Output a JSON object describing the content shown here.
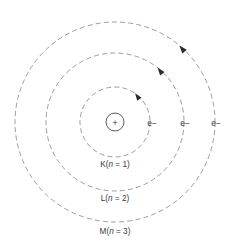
{
  "figure": {
    "background_color": "#ffffff",
    "orbit_color": "#8a8a8a",
    "text_color": "#3a3a3a",
    "arrow_color": "#2b2b2b",
    "center": {
      "x": 115,
      "y": 122
    }
  },
  "nucleus": {
    "symbol": "+",
    "radius": 9,
    "name": "nucleus"
  },
  "shells": [
    {
      "key": "K",
      "label_letter": "K",
      "label_paren_open": "(",
      "label_var": "n",
      "label_eq": " = ",
      "label_value": "1",
      "label_paren_close": ")",
      "label_full": "K(n = 1)",
      "radius": 35,
      "label_x": 115,
      "label_y": 167
    },
    {
      "key": "L",
      "label_letter": "L",
      "label_paren_open": "(",
      "label_var": "n",
      "label_eq": " = ",
      "label_value": "2",
      "label_paren_close": ")",
      "label_full": "L(n = 2)",
      "radius": 69,
      "label_x": 115,
      "label_y": 201
    },
    {
      "key": "M",
      "label_letter": "M",
      "label_paren_open": "(",
      "label_var": "n",
      "label_eq": " = ",
      "label_value": "3",
      "label_paren_close": ")",
      "label_full": "M(n = 3)",
      "radius": 100,
      "label_x": 115,
      "label_y": 234
    }
  ],
  "electrons": [
    {
      "shell": "K",
      "label": "e−",
      "x": 152,
      "y": 126
    },
    {
      "shell": "L",
      "label": "e−",
      "x": 185,
      "y": 126
    },
    {
      "shell": "M",
      "label": "e−",
      "x": 216,
      "y": 126
    }
  ],
  "arrows": [
    {
      "shell": "K",
      "direction": "counterclockwise",
      "angle_deg": 55
    },
    {
      "shell": "L",
      "direction": "counterclockwise",
      "angle_deg": 52
    },
    {
      "shell": "M",
      "direction": "counterclockwise",
      "angle_deg": 50
    }
  ]
}
